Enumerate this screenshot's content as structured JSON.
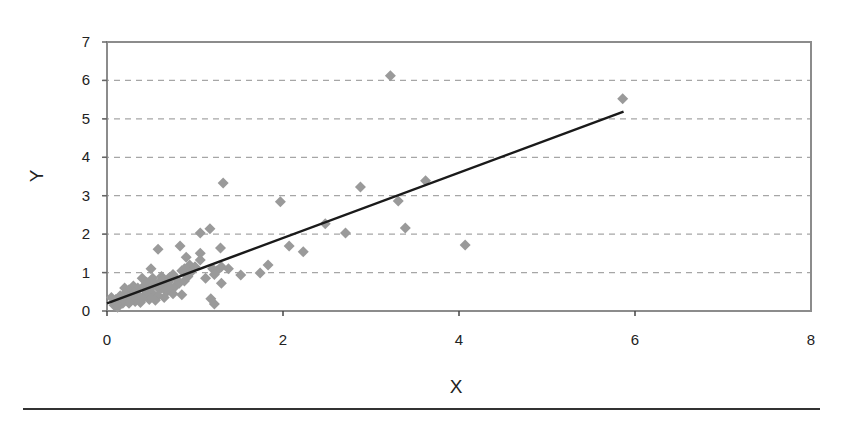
{
  "chart_data": {
    "type": "scatter",
    "title": "",
    "xlabel": "X",
    "ylabel": "Y",
    "xlim": [
      0,
      8
    ],
    "ylim": [
      0,
      7
    ],
    "xticks": [
      0,
      2,
      4,
      6,
      8
    ],
    "yticks": [
      0,
      1,
      2,
      3,
      4,
      5,
      6,
      7
    ],
    "grid": {
      "horizontal": true,
      "vertical": false,
      "style": "dashed"
    },
    "legend": null,
    "marker": {
      "shape": "diamond",
      "color": "#9a9a9a"
    },
    "trendline": {
      "type": "linear",
      "color": "#1a1a1a",
      "slope": 0.85,
      "intercept": 0.2,
      "x_start": 0,
      "x_end": 5.87
    },
    "series": [
      {
        "name": "data",
        "points": [
          [
            3.22,
            6.12
          ],
          [
            5.86,
            5.52
          ],
          [
            1.32,
            3.33
          ],
          [
            1.97,
            2.84
          ],
          [
            2.88,
            3.23
          ],
          [
            3.31,
            2.86
          ],
          [
            3.62,
            3.39
          ],
          [
            3.39,
            2.16
          ],
          [
            4.07,
            1.72
          ],
          [
            2.71,
            2.03
          ],
          [
            2.48,
            2.27
          ],
          [
            2.07,
            1.69
          ],
          [
            2.23,
            1.54
          ],
          [
            1.83,
            1.2
          ],
          [
            1.74,
            0.99
          ],
          [
            1.52,
            0.94
          ],
          [
            1.17,
            2.14
          ],
          [
            1.06,
            2.03
          ],
          [
            1.29,
            1.64
          ],
          [
            0.58,
            1.61
          ],
          [
            0.83,
            1.69
          ],
          [
            1.06,
            1.5
          ],
          [
            1.06,
            1.33
          ],
          [
            0.9,
            1.4
          ],
          [
            0.94,
            1.2
          ],
          [
            1.2,
            1.1
          ],
          [
            1.25,
            1.05
          ],
          [
            1.3,
            1.15
          ],
          [
            1.38,
            1.1
          ],
          [
            1.22,
            0.95
          ],
          [
            1.12,
            0.85
          ],
          [
            1.3,
            0.72
          ],
          [
            1.18,
            0.32
          ],
          [
            1.22,
            0.18
          ],
          [
            0.85,
            0.42
          ],
          [
            0.5,
            1.1
          ],
          [
            0.62,
            0.9
          ],
          [
            0.75,
            0.95
          ],
          [
            0.85,
            1.05
          ],
          [
            0.92,
            0.9
          ],
          [
            0.8,
            0.8
          ],
          [
            0.7,
            0.75
          ],
          [
            0.65,
            0.65
          ],
          [
            0.55,
            0.7
          ],
          [
            0.45,
            0.75
          ],
          [
            0.4,
            0.85
          ],
          [
            0.35,
            0.6
          ],
          [
            0.3,
            0.65
          ],
          [
            0.25,
            0.55
          ],
          [
            0.2,
            0.6
          ],
          [
            0.15,
            0.4
          ],
          [
            0.1,
            0.3
          ],
          [
            0.05,
            0.35
          ],
          [
            0.08,
            0.15
          ],
          [
            0.12,
            0.1
          ],
          [
            0.18,
            0.2
          ],
          [
            0.22,
            0.3
          ],
          [
            0.28,
            0.35
          ],
          [
            0.32,
            0.25
          ],
          [
            0.38,
            0.22
          ],
          [
            0.42,
            0.4
          ],
          [
            0.48,
            0.3
          ],
          [
            0.52,
            0.45
          ],
          [
            0.58,
            0.4
          ],
          [
            0.6,
            0.55
          ],
          [
            0.68,
            0.5
          ],
          [
            0.72,
            0.6
          ],
          [
            0.78,
            0.65
          ],
          [
            0.82,
            0.72
          ],
          [
            0.88,
            0.78
          ],
          [
            0.45,
            0.5
          ],
          [
            0.55,
            0.28
          ],
          [
            0.65,
            0.35
          ],
          [
            0.35,
            0.42
          ],
          [
            0.25,
            0.2
          ],
          [
            0.15,
            0.22
          ],
          [
            0.4,
            0.3
          ],
          [
            0.5,
            0.6
          ],
          [
            0.6,
            0.7
          ],
          [
            0.7,
            0.85
          ],
          [
            0.75,
            0.45
          ],
          [
            0.3,
            0.48
          ],
          [
            0.2,
            0.45
          ],
          [
            0.1,
            0.18
          ],
          [
            0.95,
            1.0
          ],
          [
            1.0,
            1.15
          ],
          [
            0.88,
            1.1
          ],
          [
            0.62,
            0.8
          ],
          [
            0.52,
            0.85
          ],
          [
            0.42,
            0.65
          ]
        ]
      }
    ]
  },
  "axes": {
    "x_title": "X",
    "y_title": "Y",
    "x_tick_labels": [
      "0",
      "2",
      "4",
      "6",
      "8"
    ],
    "y_tick_labels": [
      "0",
      "1",
      "2",
      "3",
      "4",
      "5",
      "6",
      "7"
    ]
  },
  "colors": {
    "marker": "#9a9a9a",
    "trendline": "#1a1a1a",
    "plot_border": "#8c8c8c",
    "gridline": "#a6a6a6",
    "rule": "#333333"
  }
}
